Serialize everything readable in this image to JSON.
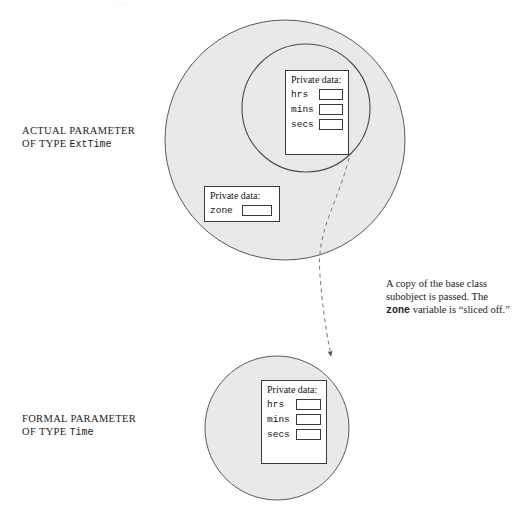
{
  "diagram": {
    "type": "object-slicing-illustration",
    "colors": {
      "circle_fill": "#e9e9e9",
      "circle_stroke": "#555555",
      "box_stroke": "#3a3a3a",
      "box_fill": "#ffffff",
      "arrow_stroke": "#666666",
      "text": "#1a1a1a"
    },
    "labels": {
      "actual_line1": "ACTUAL PARAMETER",
      "actual_line2_prefix": "OF TYPE ",
      "actual_line2_type": "ExtTime",
      "formal_line1": "FORMAL PARAMETER",
      "formal_line2_prefix": "OF TYPE ",
      "formal_line2_type": "Time"
    },
    "annotation": {
      "part1": "A copy of the base class subobject is passed.  The ",
      "code": "zone",
      "part2": " variable is “sliced off.”"
    },
    "actual_parameter": {
      "outer_circle": {
        "cx": 285,
        "cy": 140,
        "r": 120
      },
      "inner_circle": {
        "cx": 306,
        "cy": 108,
        "r": 64
      },
      "inner_box": {
        "title": "Private data:",
        "fields": [
          {
            "name": "hrs",
            "value": ""
          },
          {
            "name": "mins",
            "value": ""
          },
          {
            "name": "secs",
            "value": ""
          }
        ]
      },
      "zone_box": {
        "title": "Private data:",
        "fields": [
          {
            "name": "zone",
            "value": ""
          }
        ]
      }
    },
    "formal_parameter": {
      "circle": {
        "cx": 277,
        "cy": 428,
        "r": 72
      },
      "box": {
        "title": "Private data:",
        "fields": [
          {
            "name": "hrs",
            "value": ""
          },
          {
            "name": "mins",
            "value": ""
          },
          {
            "name": "secs",
            "value": ""
          }
        ]
      }
    },
    "arrow": {
      "kind": "dashed-curved-arrow",
      "from": {
        "x": 349,
        "y": 158
      },
      "to": {
        "x": 330,
        "y": 359
      },
      "control": {
        "x": 320,
        "y": 262
      }
    },
    "scan_artifact_top": "·  ·     ·   ·"
  }
}
